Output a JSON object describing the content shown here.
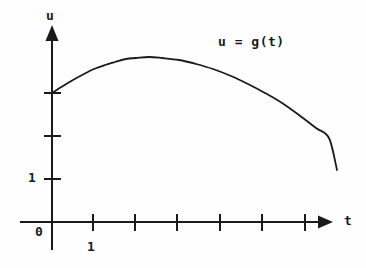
{
  "figure": {
    "background_color": "#fefefe",
    "ink_color": "#1a1a1a",
    "width": 366,
    "height": 268
  },
  "labels": {
    "y_axis_name": "u",
    "x_axis_name": "t",
    "origin": "0",
    "y_tick_one": "1",
    "x_tick_one": "1",
    "curve_equation": "u = g(t)"
  },
  "chart_data": {
    "type": "line",
    "title": "",
    "subtitle": "",
    "xlabel": "t",
    "ylabel": "u",
    "grid": false,
    "legend": null,
    "annotations": [
      {
        "text": "u = g(t)",
        "x_px": 218,
        "y_px": 35,
        "describes": "curve"
      }
    ],
    "axes": {
      "x": {
        "label": "t",
        "origin_px": 52,
        "arrow_tip_px": 333,
        "axis_y_px": 222,
        "tick_spacing_px": 42,
        "tick_positions_px": [
          93,
          135,
          177,
          220,
          262,
          305
        ],
        "tick_values": [
          1,
          2,
          3,
          4,
          5,
          6
        ],
        "labeled_ticks": [
          {
            "value": 1,
            "text": "1",
            "x_px": 93
          }
        ],
        "xlim": [
          0,
          6.7
        ]
      },
      "y": {
        "label": "u",
        "origin_px": 222,
        "arrow_tip_px": 25,
        "axis_x_px": 52,
        "tick_spacing_px": 43,
        "tick_positions_px": [
          93,
          136,
          179
        ],
        "tick_values": [
          3,
          2,
          1
        ],
        "labeled_ticks": [
          {
            "value": 1,
            "text": "1",
            "y_px": 179
          }
        ],
        "ylim": [
          0,
          4.6
        ]
      },
      "grid": false,
      "legend_position": "none"
    },
    "series": [
      {
        "name": "u = g(t)",
        "color": "#1a1a1a",
        "linewidth": 1.8,
        "description": "Smooth concave curve starting at u=3 when t=0, rising to a maximum near t=2.3, then falling steeply to the right edge.",
        "x": [
          0.0,
          0.25,
          0.5,
          0.75,
          1.0,
          1.25,
          1.5,
          1.75,
          2.0,
          2.3,
          2.6,
          3.0,
          3.4,
          3.8,
          4.2,
          4.6,
          5.0,
          5.4,
          5.8,
          6.2,
          6.5,
          6.8
        ],
        "y": [
          3.0,
          3.24,
          3.45,
          3.64,
          3.8,
          3.93,
          4.03,
          4.1,
          4.14,
          4.15,
          4.12,
          4.04,
          3.9,
          3.72,
          3.5,
          3.24,
          2.94,
          2.6,
          2.22,
          1.8,
          1.46,
          1.2
        ],
        "points_px": [
          [
            52,
            93
          ],
          [
            63,
            86
          ],
          [
            73,
            80
          ],
          [
            84,
            74
          ],
          [
            94,
            69
          ],
          [
            105,
            65
          ],
          [
            115,
            62
          ],
          [
            126,
            59
          ],
          [
            136,
            58
          ],
          [
            149,
            57
          ],
          [
            162,
            58
          ],
          [
            179,
            60
          ],
          [
            196,
            64
          ],
          [
            213,
            69
          ],
          [
            231,
            76
          ],
          [
            248,
            84
          ],
          [
            265,
            93
          ],
          [
            282,
            103
          ],
          [
            299,
            115
          ],
          [
            316,
            128
          ],
          [
            329,
            138
          ],
          [
            337,
            170
          ]
        ],
        "start_point_px": [
          52,
          93
        ],
        "peak_point_px": [
          148,
          44
        ],
        "end_point_px": [
          337,
          170
        ]
      }
    ]
  }
}
